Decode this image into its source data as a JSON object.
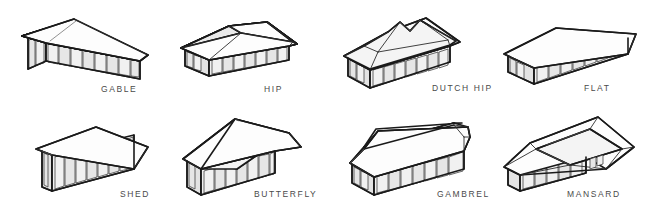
{
  "diagram": {
    "type": "line-art illustration grid",
    "columns": 4,
    "rows": 2,
    "stroke_color": "#1a1a1a",
    "label_color": "#4a4a4a",
    "background_color": "#ffffff"
  },
  "items": [
    {
      "id": "gable",
      "label": "GABLE",
      "row": 1,
      "column": 1,
      "label_x": 101,
      "label_y": 88,
      "description": "Two sloping roof planes meeting at a central ridge with triangular gable ends"
    },
    {
      "id": "hip",
      "label": "HIP",
      "row": 1,
      "column": 2,
      "label_x": 264,
      "label_y": 88,
      "description": "Four sloping planes rising to a short central ridge, no vertical gable ends"
    },
    {
      "id": "dutch-hip",
      "label": "DUTCH HIP",
      "row": 1,
      "column": 3,
      "label_x": 432,
      "label_y": 87,
      "description": "Hip roof with small gablets near the ridge ends"
    },
    {
      "id": "flat",
      "label": "FLAT",
      "row": 1,
      "column": 4,
      "label_x": 584,
      "label_y": 87,
      "description": "Single horizontal plane with slight overhang on all sides"
    },
    {
      "id": "shed",
      "label": "SHED",
      "row": 2,
      "column": 1,
      "label_x": 120,
      "label_y": 193,
      "description": "Single roof plane sloping in one direction"
    },
    {
      "id": "butterfly",
      "label": "BUTTERFLY",
      "row": 2,
      "column": 2,
      "label_x": 254,
      "label_y": 192,
      "description": "Two planes sloping inward to a central valley"
    },
    {
      "id": "gambrel",
      "label": "GAMBREL",
      "row": 2,
      "column": 3,
      "label_x": 437,
      "label_y": 192,
      "description": "Barn style roof, two slopes per side with a break in pitch"
    },
    {
      "id": "mansard",
      "label": "MANSARD",
      "row": 2,
      "column": 4,
      "label_x": 567,
      "label_y": 192,
      "description": "Four sided roof with steep lower slopes and a shallow flat top deck"
    }
  ]
}
